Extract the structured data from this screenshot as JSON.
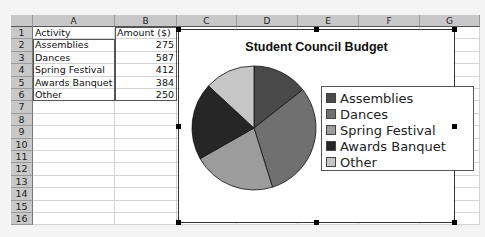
{
  "spreadsheet": {
    "columns": [
      {
        "label": "A",
        "x": 22,
        "w": 82
      },
      {
        "label": "B",
        "x": 104,
        "w": 62
      },
      {
        "label": "C",
        "x": 166,
        "w": 60
      },
      {
        "label": "D",
        "x": 226,
        "w": 61
      },
      {
        "label": "E",
        "x": 287,
        "w": 61
      },
      {
        "label": "F",
        "x": 348,
        "w": 61
      },
      {
        "label": "G",
        "x": 409,
        "w": 60
      }
    ],
    "rows": [
      "1",
      "2",
      "3",
      "4",
      "5",
      "6",
      "7",
      "8",
      "9",
      "10",
      "11",
      "12",
      "13",
      "14",
      "15",
      "16"
    ],
    "cells": [
      [
        "Activity",
        "Amount ($)"
      ],
      [
        "Assemblies",
        "275"
      ],
      [
        "Dances",
        "587"
      ],
      [
        "Spring Festival",
        "412"
      ],
      [
        "Awards Banquet",
        "384"
      ],
      [
        "Other",
        "250"
      ]
    ]
  },
  "chart": {
    "title": "Student Council Budget",
    "legend": [
      {
        "label": "Assemblies",
        "color": "#4a4a4a"
      },
      {
        "label": "Dances",
        "color": "#707070"
      },
      {
        "label": "Spring Festival",
        "color": "#9c9c9c"
      },
      {
        "label": "Awards Banquet",
        "color": "#262626"
      },
      {
        "label": "Other",
        "color": "#c6c6c6"
      }
    ]
  },
  "chart_data": {
    "type": "pie",
    "title": "Student Council Budget",
    "categories": [
      "Assemblies",
      "Dances",
      "Spring Festival",
      "Awards Banquet",
      "Other"
    ],
    "values": [
      275,
      587,
      412,
      384,
      250
    ],
    "colors": [
      "#4a4a4a",
      "#707070",
      "#9c9c9c",
      "#262626",
      "#c6c6c6"
    ],
    "start_angle": "12 o'clock, clockwise",
    "legend_position": "right"
  }
}
